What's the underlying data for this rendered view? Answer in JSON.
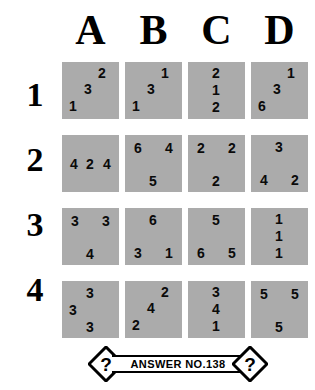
{
  "puzzle": {
    "column_headers": [
      "A",
      "B",
      "C",
      "D"
    ],
    "row_labels": [
      "1",
      "2",
      "3",
      "4"
    ],
    "cell_color": "#ababab",
    "rows": [
      {
        "label": "1",
        "cells": [
          {
            "id": "A1",
            "layout": "diagonal",
            "digits": [
              "2",
              "3",
              "1"
            ]
          },
          {
            "id": "B1",
            "layout": "diagonal",
            "digits": [
              "1",
              "3",
              "1"
            ]
          },
          {
            "id": "C1",
            "layout": "vertical",
            "digits": [
              "2",
              "1",
              "2"
            ]
          },
          {
            "id": "D1",
            "layout": "diagonal",
            "digits": [
              "1",
              "3",
              "6"
            ]
          }
        ]
      },
      {
        "label": "2",
        "cells": [
          {
            "id": "A2",
            "layout": "horizontal",
            "digits": [
              "4",
              "2",
              "4"
            ]
          },
          {
            "id": "B2",
            "layout": "top-pair",
            "digits": [
              "6",
              "4",
              "5"
            ]
          },
          {
            "id": "C2",
            "layout": "top-pair",
            "digits": [
              "2",
              "2",
              "2"
            ]
          },
          {
            "id": "D2",
            "layout": "bottom-pair",
            "digits": [
              "3",
              "4",
              "2"
            ]
          }
        ]
      },
      {
        "label": "3",
        "cells": [
          {
            "id": "A3",
            "layout": "top-pair",
            "digits": [
              "3",
              "3",
              "4"
            ]
          },
          {
            "id": "B3",
            "layout": "bottom-pair",
            "digits": [
              "6",
              "3",
              "1"
            ]
          },
          {
            "id": "C3",
            "layout": "bottom-pair",
            "digits": [
              "5",
              "6",
              "5"
            ]
          },
          {
            "id": "D3",
            "layout": "vertical",
            "digits": [
              "1",
              "1",
              "1"
            ]
          }
        ]
      },
      {
        "label": "4",
        "cells": [
          {
            "id": "A4",
            "layout": "left-mid",
            "digits": [
              "3",
              "3",
              "3"
            ]
          },
          {
            "id": "B4",
            "layout": "diagonal",
            "digits": [
              "2",
              "4",
              "2"
            ]
          },
          {
            "id": "C4",
            "layout": "vertical",
            "digits": [
              "3",
              "4",
              "1"
            ]
          },
          {
            "id": "D4",
            "layout": "top-pair",
            "digits": [
              "5",
              "5",
              "5"
            ]
          }
        ]
      }
    ]
  },
  "banner": {
    "text": "ANSWER NO.138",
    "left_symbol": "?",
    "right_symbol": "?"
  }
}
